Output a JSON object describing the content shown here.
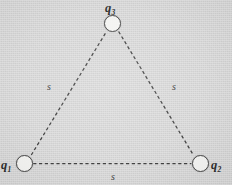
{
  "figure": {
    "kind": "physics-diagram",
    "background_color": "#d6d6d6",
    "ink_color": "#3c3c3c",
    "node_fill_color": "#f3f3f1"
  },
  "charges": [
    {
      "id": "q1",
      "letter": "q",
      "subscript": "1",
      "label_position": "left-of-node",
      "cx": 24.5,
      "cy": 163.5,
      "radius": 8.5
    },
    {
      "id": "q2",
      "letter": "q",
      "subscript": "2",
      "label_position": "right-of-node",
      "cx": 200.0,
      "cy": 163.5,
      "radius": 8.5
    },
    {
      "id": "q3",
      "letter": "q",
      "subscript": "3",
      "label_position": "above-node",
      "cx": 112.5,
      "cy": 23.5,
      "radius": 8.5
    }
  ],
  "sides": [
    {
      "id": "side-q1-q3",
      "label": "s",
      "from": "q1",
      "to": "q3",
      "style": "dashed",
      "label_x": 47,
      "label_y": 82
    },
    {
      "id": "side-q3-q2",
      "label": "s",
      "from": "q3",
      "to": "q2",
      "style": "dashed",
      "label_x": 172,
      "label_y": 82
    },
    {
      "id": "side-q1-q2",
      "label": "s",
      "from": "q1",
      "to": "q2",
      "style": "dashed",
      "label_x": 111,
      "label_y": 172
    }
  ]
}
